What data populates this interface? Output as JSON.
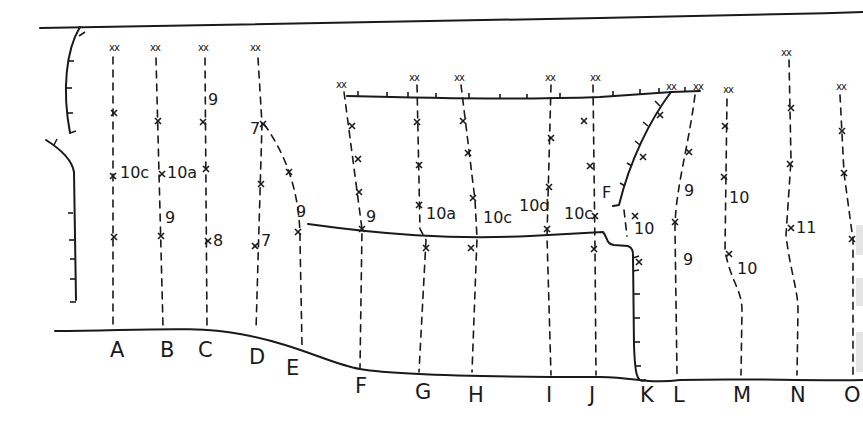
{
  "diagram": {
    "type": "climbing-route-topo",
    "ink_color": "#1a1a1a",
    "background": "#ffffff",
    "route_labels": [
      {
        "id": "A",
        "x": 117,
        "y": 357
      },
      {
        "id": "B",
        "x": 167,
        "y": 357
      },
      {
        "id": "C",
        "x": 205,
        "y": 357
      },
      {
        "id": "D",
        "x": 256,
        "y": 364
      },
      {
        "id": "E",
        "x": 293,
        "y": 375
      },
      {
        "id": "F",
        "x": 362,
        "y": 393
      },
      {
        "id": "G",
        "x": 422,
        "y": 399
      },
      {
        "id": "H",
        "x": 475,
        "y": 402
      },
      {
        "id": "I",
        "x": 553,
        "y": 402
      },
      {
        "id": "J",
        "x": 596,
        "y": 402
      },
      {
        "id": "K",
        "x": 647,
        "y": 402
      },
      {
        "id": "L",
        "x": 680,
        "y": 402
      },
      {
        "id": "M",
        "x": 740,
        "y": 402
      },
      {
        "id": "N",
        "x": 797,
        "y": 402
      },
      {
        "id": "O",
        "x": 851,
        "y": 402
      }
    ],
    "grades": [
      {
        "text": "10c",
        "x": 120,
        "y": 178
      },
      {
        "text": "10a",
        "x": 167,
        "y": 178
      },
      {
        "text": "9",
        "x": 208,
        "y": 105
      },
      {
        "text": "9",
        "x": 165,
        "y": 223
      },
      {
        "text": "8",
        "x": 213,
        "y": 246
      },
      {
        "text": "7",
        "x": 250,
        "y": 134
      },
      {
        "text": "7",
        "x": 261,
        "y": 246
      },
      {
        "text": "9",
        "x": 296,
        "y": 217
      },
      {
        "text": "9",
        "x": 366,
        "y": 222
      },
      {
        "text": "10a",
        "x": 426,
        "y": 219
      },
      {
        "text": "10c",
        "x": 483,
        "y": 223
      },
      {
        "text": "10d",
        "x": 519,
        "y": 211
      },
      {
        "text": "10c",
        "x": 564,
        "y": 219
      },
      {
        "text": "F",
        "x": 602,
        "y": 198
      },
      {
        "text": "10",
        "x": 634,
        "y": 234
      },
      {
        "text": "9",
        "x": 684,
        "y": 196
      },
      {
        "text": "9",
        "x": 683,
        "y": 265
      },
      {
        "text": "10",
        "x": 729,
        "y": 203
      },
      {
        "text": "10",
        "x": 737,
        "y": 274
      },
      {
        "text": "11",
        "x": 796,
        "y": 233
      }
    ],
    "anchors": [
      {
        "text": "xx",
        "x": 109,
        "y": 51
      },
      {
        "text": "xx",
        "x": 150,
        "y": 51
      },
      {
        "text": "xx",
        "x": 198,
        "y": 51
      },
      {
        "text": "xx",
        "x": 250,
        "y": 51
      },
      {
        "text": "xx",
        "x": 336,
        "y": 88
      },
      {
        "text": "xx",
        "x": 409,
        "y": 81
      },
      {
        "text": "xx",
        "x": 454,
        "y": 81
      },
      {
        "text": "xx",
        "x": 545,
        "y": 81
      },
      {
        "text": "xx",
        "x": 590,
        "y": 81
      },
      {
        "text": "xx",
        "x": 666,
        "y": 90
      },
      {
        "text": "xx",
        "x": 693,
        "y": 90
      },
      {
        "text": "xx",
        "x": 723,
        "y": 93
      },
      {
        "text": "xx",
        "x": 781,
        "y": 56
      },
      {
        "text": "xx",
        "x": 836,
        "y": 90
      }
    ],
    "bolts": [
      {
        "x": 114,
        "y": 113
      },
      {
        "x": 113,
        "y": 176
      },
      {
        "x": 114,
        "y": 237
      },
      {
        "x": 158,
        "y": 121
      },
      {
        "x": 162,
        "y": 174
      },
      {
        "x": 161,
        "y": 236
      },
      {
        "x": 203,
        "y": 122
      },
      {
        "x": 206,
        "y": 169
      },
      {
        "x": 208,
        "y": 241
      },
      {
        "x": 263,
        "y": 124
      },
      {
        "x": 261,
        "y": 184
      },
      {
        "x": 255,
        "y": 246
      },
      {
        "x": 289,
        "y": 172
      },
      {
        "x": 298,
        "y": 232
      },
      {
        "x": 352,
        "y": 126
      },
      {
        "x": 358,
        "y": 159
      },
      {
        "x": 359,
        "y": 192
      },
      {
        "x": 362,
        "y": 229
      },
      {
        "x": 417,
        "y": 122
      },
      {
        "x": 419,
        "y": 165
      },
      {
        "x": 419,
        "y": 205
      },
      {
        "x": 426,
        "y": 248
      },
      {
        "x": 463,
        "y": 121
      },
      {
        "x": 468,
        "y": 153
      },
      {
        "x": 473,
        "y": 198
      },
      {
        "x": 471,
        "y": 248
      },
      {
        "x": 551,
        "y": 138
      },
      {
        "x": 549,
        "y": 187
      },
      {
        "x": 547,
        "y": 229
      },
      {
        "x": 584,
        "y": 121
      },
      {
        "x": 590,
        "y": 166
      },
      {
        "x": 595,
        "y": 216
      },
      {
        "x": 594,
        "y": 249
      },
      {
        "x": 635,
        "y": 216
      },
      {
        "x": 639,
        "y": 262
      },
      {
        "x": 660,
        "y": 115
      },
      {
        "x": 643,
        "y": 157
      },
      {
        "x": 689,
        "y": 152
      },
      {
        "x": 675,
        "y": 222
      },
      {
        "x": 725,
        "y": 126
      },
      {
        "x": 724,
        "y": 177
      },
      {
        "x": 729,
        "y": 254
      },
      {
        "x": 791,
        "y": 108
      },
      {
        "x": 790,
        "y": 164
      },
      {
        "x": 791,
        "y": 228
      },
      {
        "x": 842,
        "y": 131
      },
      {
        "x": 844,
        "y": 173
      },
      {
        "x": 852,
        "y": 239
      }
    ]
  }
}
